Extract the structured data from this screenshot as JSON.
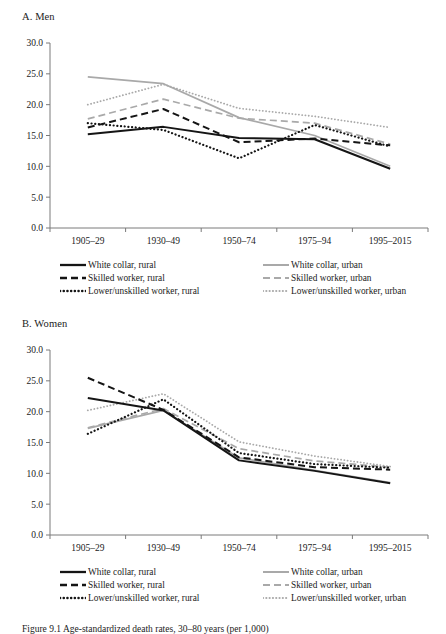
{
  "figure": {
    "caption": "Figure 9.1  Age-standardized death rates, 30–80 years (per 1,000)"
  },
  "panels": [
    {
      "id": "men",
      "title": "A. Men"
    },
    {
      "id": "women",
      "title": "B. Women"
    }
  ],
  "legend": {
    "rows": [
      {
        "left": {
          "label": "White collar, rural",
          "style": "solid-black"
        },
        "right": {
          "label": "White collar, urban",
          "style": "solid-gray"
        }
      },
      {
        "left": {
          "label": "Skilled worker, rural",
          "style": "dashed-black"
        },
        "right": {
          "label": "Skilled worker, urban",
          "style": "dashed-gray"
        }
      },
      {
        "left": {
          "label": "Lower/unskilled worker, rural",
          "style": "dotted-black"
        },
        "right": {
          "label": "Lower/unskilled worker, urban",
          "style": "dotted-gray"
        }
      }
    ]
  },
  "colors": {
    "black": "#151515",
    "gray": "#a9a9a9",
    "axis": "#7a7a7a"
  },
  "chart_data": [
    {
      "type": "line",
      "id": "men",
      "title": "A. Men",
      "xlabel": "",
      "ylabel": "",
      "categories": [
        "1905–29",
        "1930–49",
        "1950–74",
        "1975–94",
        "1995–2015"
      ],
      "ylim": [
        0,
        30
      ],
      "yticks": [
        "0.0",
        "5.0",
        "10.0",
        "15.0",
        "20.0",
        "25.0",
        "30.0"
      ],
      "ytick_values": [
        0,
        5,
        10,
        15,
        20,
        25,
        30
      ],
      "grid": false,
      "legend_position": "bottom",
      "series": [
        {
          "name": "White collar, rural",
          "style": "solid-black",
          "values": [
            15.2,
            16.4,
            14.6,
            14.4,
            9.6
          ]
        },
        {
          "name": "Skilled worker, rural",
          "style": "dashed-black",
          "values": [
            16.3,
            19.3,
            13.9,
            14.5,
            13.4
          ]
        },
        {
          "name": "Lower/unskilled worker, rural",
          "style": "dotted-black",
          "values": [
            17.0,
            15.9,
            11.3,
            16.7,
            13.2
          ]
        },
        {
          "name": "White collar, urban",
          "style": "solid-gray",
          "values": [
            24.5,
            23.4,
            17.9,
            15.0,
            10.0
          ]
        },
        {
          "name": "Skilled worker, urban",
          "style": "dashed-gray",
          "values": [
            17.7,
            20.9,
            17.8,
            17.0,
            13.6
          ]
        },
        {
          "name": "Lower/unskilled worker, urban",
          "style": "dotted-gray",
          "values": [
            20.0,
            23.3,
            19.4,
            18.1,
            16.3
          ]
        }
      ]
    },
    {
      "type": "line",
      "id": "women",
      "title": "B. Women",
      "xlabel": "",
      "ylabel": "",
      "categories": [
        "1905–29",
        "1930–49",
        "1950–74",
        "1975–94",
        "1995–2015"
      ],
      "ylim": [
        0,
        30
      ],
      "yticks": [
        "0.0",
        "5.0",
        "10.0",
        "15.0",
        "20.0",
        "25.0",
        "30.0"
      ],
      "ytick_values": [
        0,
        5,
        10,
        15,
        20,
        25,
        30
      ],
      "grid": false,
      "legend_position": "bottom",
      "series": [
        {
          "name": "White collar, rural",
          "style": "solid-black",
          "values": [
            22.2,
            20.2,
            12.1,
            10.4,
            8.4
          ]
        },
        {
          "name": "Skilled worker, rural",
          "style": "dashed-black",
          "values": [
            25.5,
            20.3,
            12.6,
            11.0,
            10.6
          ]
        },
        {
          "name": "Lower/unskilled worker, rural",
          "style": "dotted-black",
          "values": [
            16.4,
            22.0,
            13.3,
            11.5,
            10.9
          ]
        },
        {
          "name": "White collar, urban",
          "style": "solid-gray",
          "values": [
            17.3,
            20.2,
            12.5,
            10.5,
            8.5
          ]
        },
        {
          "name": "Skilled worker, urban",
          "style": "dashed-gray",
          "values": [
            17.4,
            20.5,
            14.0,
            12.0,
            11.0
          ]
        },
        {
          "name": "Lower/unskilled worker, urban",
          "style": "dotted-gray",
          "values": [
            20.2,
            22.9,
            15.1,
            12.8,
            11.1
          ]
        }
      ]
    }
  ]
}
